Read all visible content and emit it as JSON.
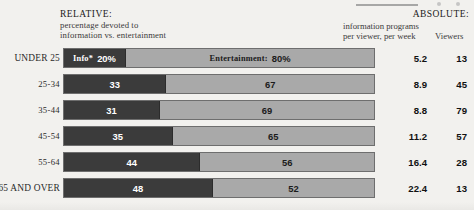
{
  "headers": {
    "relative_title": "RELATIVE:",
    "relative_sub_line1": "percentage devoted to",
    "relative_sub_line2": "information vs. entertainment",
    "absolute_title": "ABSOLUTE:",
    "absolute_sub_line1": "information programs",
    "absolute_sub_line2": "per viewer, per week",
    "viewers_header": "Viewers"
  },
  "legend": {
    "info_label": "Info*",
    "entertainment_label": "Entertainment:"
  },
  "colors": {
    "info_segment": "#3b3b3b",
    "entertainment_segment": "#a9a9a9",
    "bar_border": "#6e6e6e",
    "page_background": "#f2f1ee",
    "text": "#1d1d1d"
  },
  "chart_data": {
    "type": "bar",
    "title": "RELATIVE: percentage devoted to information vs. entertainment",
    "subtype": "stacked-horizontal-100pct",
    "xlabel": "",
    "ylabel": "",
    "xlim": [
      0,
      100
    ],
    "grid": false,
    "legend_position": "in-bar",
    "categories": [
      "UNDER 25",
      "25-34",
      "35-44",
      "45-54",
      "55-64",
      "65 AND OVER"
    ],
    "series": [
      {
        "name": "Info",
        "values": [
          20,
          33,
          31,
          35,
          44,
          48
        ]
      },
      {
        "name": "Entertainment",
        "values": [
          80,
          67,
          69,
          65,
          56,
          52
        ]
      }
    ],
    "extra_columns": [
      {
        "name": "information programs per viewer, per week",
        "values": [
          "5.2",
          "8.9",
          "8.8",
          "11.2",
          "16.4",
          "22.4"
        ]
      },
      {
        "name": "Viewers",
        "values": [
          "13",
          "45",
          "79",
          "57",
          "28",
          "13"
        ]
      }
    ]
  },
  "rows": [
    {
      "label": "UNDER 25",
      "smallcaps": true,
      "info_pct": 20,
      "ent_pct": 80,
      "info_text": "20%",
      "ent_text": "80%",
      "show_legend": true,
      "abs_info": "5.2",
      "viewers": "13"
    },
    {
      "label": "25-34",
      "smallcaps": false,
      "info_pct": 33,
      "ent_pct": 67,
      "info_text": "33",
      "ent_text": "67",
      "show_legend": false,
      "abs_info": "8.9",
      "viewers": "45"
    },
    {
      "label": "35-44",
      "smallcaps": false,
      "info_pct": 31,
      "ent_pct": 69,
      "info_text": "31",
      "ent_text": "69",
      "show_legend": false,
      "abs_info": "8.8",
      "viewers": "79"
    },
    {
      "label": "45-54",
      "smallcaps": false,
      "info_pct": 35,
      "ent_pct": 65,
      "info_text": "35",
      "ent_text": "65",
      "show_legend": false,
      "abs_info": "11.2",
      "viewers": "57"
    },
    {
      "label": "55-64",
      "smallcaps": false,
      "info_pct": 44,
      "ent_pct": 56,
      "info_text": "44",
      "ent_text": "56",
      "show_legend": false,
      "abs_info": "16.4",
      "viewers": "28"
    },
    {
      "label": "65 AND OVER",
      "smallcaps": true,
      "info_pct": 48,
      "ent_pct": 52,
      "info_text": "48",
      "ent_text": "52",
      "show_legend": false,
      "abs_info": "22.4",
      "viewers": "13"
    }
  ]
}
